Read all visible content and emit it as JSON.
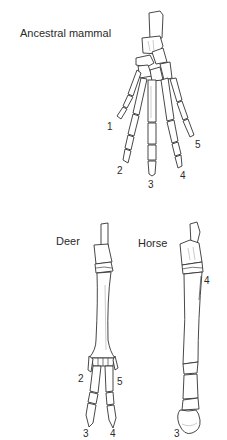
{
  "figures": [
    {
      "id": "ancestral",
      "title": "Ancestral mammal",
      "digits": [
        "1",
        "2",
        "3",
        "4",
        "5"
      ]
    },
    {
      "id": "deer",
      "title": "Deer",
      "digits": [
        "2",
        "5",
        "3",
        "4"
      ]
    },
    {
      "id": "horse",
      "title": "Horse",
      "digits": [
        "4",
        "3"
      ]
    }
  ]
}
